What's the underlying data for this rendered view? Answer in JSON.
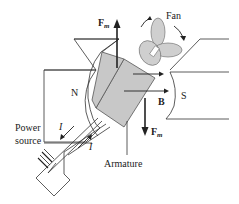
{
  "diagram": {
    "labels": {
      "force_top": "F",
      "force_top_sub": "m",
      "force_bottom": "F",
      "force_bottom_sub": "m",
      "fan": "Fan",
      "north_pole": "N",
      "south_pole": "S",
      "field": "B",
      "current_1": "I",
      "current_2": "I",
      "power_line1": "Power",
      "power_line2": "source",
      "armature": "Armature"
    },
    "colors": {
      "armature_fill": "#c8c8c8",
      "fan_fill": "#cfcfcf",
      "line": "#333333",
      "background": "#ffffff"
    }
  }
}
